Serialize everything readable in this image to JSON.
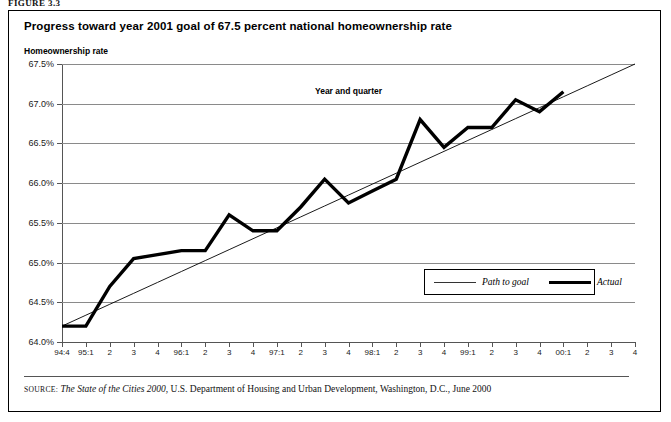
{
  "figure": {
    "label": "FIGURE 3.3"
  },
  "chart": {
    "title": "Progress toward year 2001 goal of 67.5 percent national homeownership rate",
    "ylabel": "Homeownership rate",
    "xlabel": "Year and quarter"
  },
  "legend": {
    "goal_label": "Path to goal",
    "actual_label": "Actual"
  },
  "source": {
    "kicker": "SOURCE:",
    "publication": "The State of the Cities 2000",
    "rest": ", U.S. Department of Housing and Urban Development, Washington, D.C., June 2000"
  },
  "chart_data": {
    "type": "line",
    "title": "Progress toward year 2001 goal of 67.5 percent national homeownership rate",
    "xlabel": "Year and quarter",
    "ylabel": "Homeownership rate",
    "ylim": [
      64.0,
      67.5
    ],
    "yticks": [
      64.0,
      64.5,
      65.0,
      65.5,
      66.0,
      66.5,
      67.0,
      67.5
    ],
    "ytick_labels": [
      "64.0%",
      "64.5%",
      "65.0%",
      "65.5%",
      "66.0%",
      "66.5%",
      "67.0%",
      "67.5%"
    ],
    "grid": true,
    "legend_position": "inside-lower-right",
    "categories": [
      "94:4",
      "95:1",
      "2",
      "3",
      "4",
      "96:1",
      "2",
      "3",
      "4",
      "97:1",
      "2",
      "3",
      "4",
      "98:1",
      "2",
      "3",
      "4",
      "99:1",
      "2",
      "3",
      "4",
      "00:1",
      "2",
      "3",
      "4"
    ],
    "series": [
      {
        "name": "Actual",
        "style": "thick",
        "values": [
          64.2,
          64.2,
          64.7,
          65.05,
          65.1,
          65.15,
          65.15,
          65.6,
          65.4,
          65.4,
          65.7,
          66.05,
          65.75,
          65.9,
          66.05,
          66.8,
          66.45,
          66.7,
          66.7,
          67.05,
          66.9,
          67.15,
          null,
          null,
          null
        ]
      },
      {
        "name": "Path to goal",
        "style": "thin",
        "values": [
          64.2,
          64.3375,
          64.475,
          64.6125,
          64.75,
          64.8875,
          65.025,
          65.1625,
          65.3,
          65.4375,
          65.575,
          65.7125,
          65.85,
          65.9875,
          66.125,
          66.2625,
          66.4,
          66.5375,
          66.675,
          66.8125,
          66.95,
          67.0875,
          67.225,
          67.3625,
          67.5
        ]
      }
    ]
  }
}
